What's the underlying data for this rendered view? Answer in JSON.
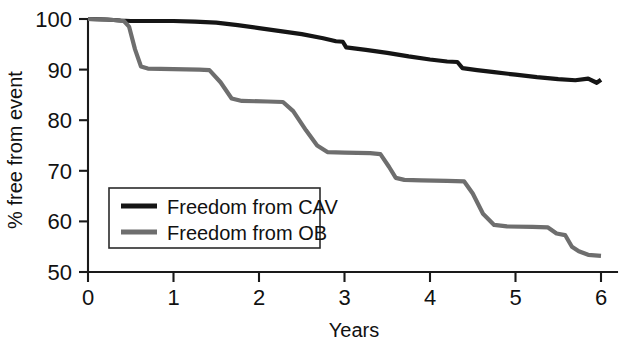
{
  "chart_data": {
    "type": "line",
    "title": "",
    "subtitle": "",
    "xlabel": "Years",
    "ylabel": "% free from event",
    "xlim": [
      0,
      6
    ],
    "ylim": [
      50,
      100
    ],
    "xticks": [
      0,
      1,
      2,
      3,
      4,
      5,
      6
    ],
    "xtick_labels": [
      "0",
      "1",
      "2",
      "3",
      "4",
      "5",
      "6"
    ],
    "yticks": [
      50,
      60,
      70,
      80,
      90,
      100
    ],
    "ytick_labels": [
      "50",
      "60",
      "70",
      "80",
      "90",
      "100"
    ],
    "grid": false,
    "legend_position": "lower left inside",
    "series": [
      {
        "name": "Freedom from CAV",
        "color": "#151515",
        "linewidth": 4.2,
        "points": [
          [
            0.0,
            100.0
          ],
          [
            0.22,
            99.9
          ],
          [
            0.38,
            99.7
          ],
          [
            0.5,
            99.6
          ],
          [
            0.75,
            99.6
          ],
          [
            1.0,
            99.6
          ],
          [
            1.25,
            99.5
          ],
          [
            1.5,
            99.3
          ],
          [
            1.75,
            98.8
          ],
          [
            2.0,
            98.2
          ],
          [
            2.25,
            97.6
          ],
          [
            2.5,
            97.0
          ],
          [
            2.75,
            96.2
          ],
          [
            2.9,
            95.6
          ],
          [
            2.98,
            95.5
          ],
          [
            3.02,
            94.4
          ],
          [
            3.25,
            93.9
          ],
          [
            3.5,
            93.3
          ],
          [
            3.75,
            92.6
          ],
          [
            4.0,
            92.0
          ],
          [
            4.2,
            91.6
          ],
          [
            4.32,
            91.5
          ],
          [
            4.38,
            90.3
          ],
          [
            4.55,
            89.9
          ],
          [
            4.75,
            89.5
          ],
          [
            5.0,
            89.0
          ],
          [
            5.25,
            88.5
          ],
          [
            5.5,
            88.1
          ],
          [
            5.7,
            87.9
          ],
          [
            5.85,
            88.2
          ],
          [
            5.95,
            87.4
          ],
          [
            6.0,
            88.0
          ]
        ]
      },
      {
        "name": "Freedom from OB",
        "color": "#6e6e6e",
        "linewidth": 4.2,
        "points": [
          [
            0.0,
            100.0
          ],
          [
            0.3,
            99.8
          ],
          [
            0.42,
            99.6
          ],
          [
            0.48,
            98.5
          ],
          [
            0.55,
            94.0
          ],
          [
            0.62,
            90.6
          ],
          [
            0.7,
            90.2
          ],
          [
            1.0,
            90.1
          ],
          [
            1.3,
            90.0
          ],
          [
            1.42,
            89.9
          ],
          [
            1.55,
            87.5
          ],
          [
            1.68,
            84.3
          ],
          [
            1.8,
            83.8
          ],
          [
            2.1,
            83.7
          ],
          [
            2.28,
            83.6
          ],
          [
            2.4,
            81.8
          ],
          [
            2.55,
            78.0
          ],
          [
            2.68,
            75.0
          ],
          [
            2.8,
            73.7
          ],
          [
            3.0,
            73.6
          ],
          [
            3.3,
            73.5
          ],
          [
            3.42,
            73.3
          ],
          [
            3.52,
            70.8
          ],
          [
            3.6,
            68.6
          ],
          [
            3.7,
            68.2
          ],
          [
            3.9,
            68.1
          ],
          [
            4.2,
            68.0
          ],
          [
            4.4,
            67.9
          ],
          [
            4.5,
            65.5
          ],
          [
            4.62,
            61.5
          ],
          [
            4.75,
            59.3
          ],
          [
            4.9,
            59.0
          ],
          [
            5.2,
            58.9
          ],
          [
            5.38,
            58.8
          ],
          [
            5.48,
            57.6
          ],
          [
            5.58,
            57.3
          ],
          [
            5.66,
            55.0
          ],
          [
            5.74,
            54.1
          ],
          [
            5.85,
            53.4
          ],
          [
            6.0,
            53.2
          ]
        ]
      }
    ],
    "legend": [
      {
        "label": "Freedom from CAV",
        "color": "#151515"
      },
      {
        "label": "Freedom from OB",
        "color": "#6e6e6e"
      }
    ]
  }
}
